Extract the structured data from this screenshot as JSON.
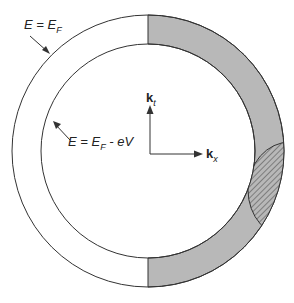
{
  "labels": {
    "outer_eq": "E = E",
    "outer_sub": "F",
    "inner_eq": "E = E",
    "inner_sub": "F",
    "inner_tail": " - eV",
    "kt": "k",
    "kt_sub": "t",
    "kx": "k",
    "kx_sub": "x"
  },
  "colors": {
    "shaded": "#b8b8b8",
    "line": "#333333"
  }
}
